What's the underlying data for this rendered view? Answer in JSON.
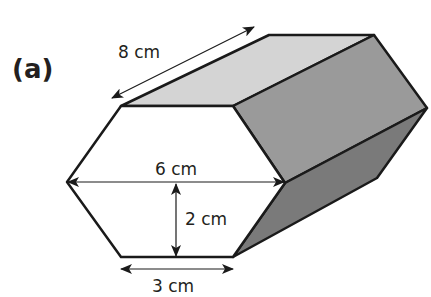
{
  "figure": {
    "part_label": "(a)",
    "shape": "hexagonal prism",
    "dimensions": {
      "length": "8 cm",
      "width": "6 cm",
      "height": "2 cm",
      "side": "3 cm"
    },
    "colors": {
      "top_face": "#d4d4d4",
      "upper_side_face": "#9a9a9a",
      "lower_side_face": "#7a7a7a",
      "front_face": "#ffffff",
      "outline": "#1a1a1a"
    }
  }
}
